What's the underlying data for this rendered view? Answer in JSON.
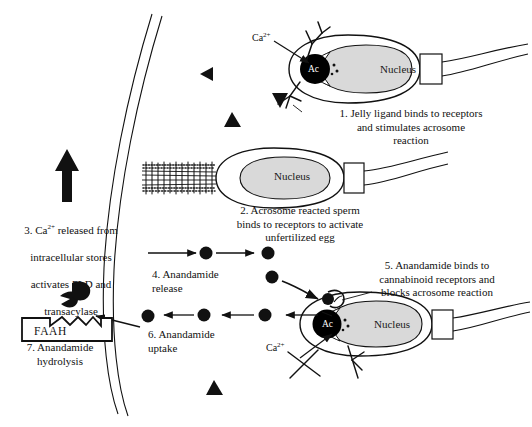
{
  "figure": {
    "width": 532,
    "height": 427,
    "background": "#ffffff",
    "ink_color": "#111111",
    "nucleus_fill": "#d9d9d9",
    "acrosome_fill": "#000000"
  },
  "captions": {
    "step1": "1. Jelly ligand binds to receptors\nand stimulates acrosome\nreaction",
    "step2": "2. Acrosome reacted sperm\nbinds to receptors to activate\nunfertilized egg",
    "step3": "3. Ca2+ released from\nintracellular stores\nactivates PLD and\ntransacylase",
    "step4": "4. Anandamide\nrelease",
    "step5": "5. Anandamide binds to\ncannabinoid receptors and\nblocks acrosome reaction",
    "step6": "6. Anandamide\nuptake",
    "step7": "7. Anandamide\nhydrolysis"
  },
  "labels": {
    "calcium_top": "Ca",
    "calcium_top_sup": "2+",
    "calcium_bottom": "Ca",
    "calcium_bottom_sup": "2+",
    "nucleus_sperm_1": "Nucleus",
    "nucleus_sperm_2": "Nucleus",
    "nucleus_sperm_3": "Nucleus",
    "acrosome_1": "Ac",
    "acrosome_3": "Ac",
    "enzyme_box": "FAAH"
  },
  "elements": {
    "egg_membrane": "egg-plasma-membrane-curve",
    "sperm_1": "sperm-unreacted-top",
    "sperm_2": "sperm-acrosome-reacted-middle",
    "sperm_3": "sperm-blocked-bottom",
    "receptor_jelly": "y-shaped-jelly-receptor",
    "receptor_cannabinoid": "cannabinoid-receptor-bound",
    "anandamide_particles": 8,
    "jelly_triangles": 5,
    "faah_enzyme": "pacman-enzyme-box"
  }
}
